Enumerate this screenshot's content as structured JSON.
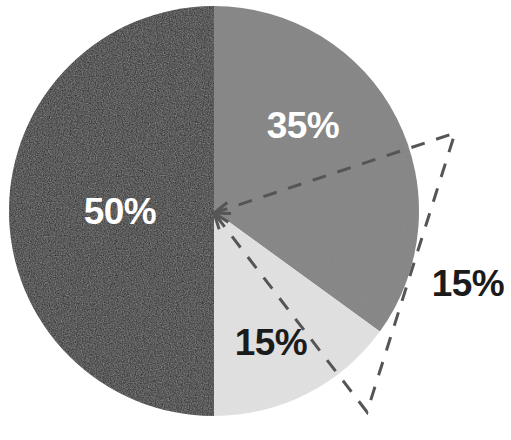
{
  "chart_data": {
    "type": "pie",
    "title": "",
    "subtitle": "",
    "xlabel": "",
    "ylabel": "",
    "legend": null,
    "grid": false,
    "categories": [
      "50%",
      "35%",
      "15%",
      "15%"
    ],
    "values": [
      50,
      35,
      15,
      15
    ],
    "slices": [
      {
        "label": "50%",
        "value": 50,
        "color": "#1a1a1a",
        "label_color": "#ffffff",
        "start_angle_deg": 180,
        "end_angle_deg": 360,
        "exploded": false,
        "callout": false
      },
      {
        "label": "35%",
        "value": 35,
        "color": "#8a8a8a",
        "label_color": "#ffffff",
        "start_angle_deg": 0,
        "end_angle_deg": 126,
        "exploded": false,
        "callout": false
      },
      {
        "label": "15%",
        "value": 15,
        "color": "#e2e2e2",
        "label_color": "#1b1b1b",
        "start_angle_deg": 126,
        "end_angle_deg": 180,
        "exploded": false,
        "callout": false
      },
      {
        "label": "15%",
        "value": 15,
        "color": "none",
        "label_color": "#1b1b1b",
        "start_angle_deg": 0,
        "end_angle_deg": 54,
        "exploded": true,
        "callout": true,
        "callout_style": "dashed-outline-wedge"
      }
    ],
    "total": 100,
    "units": "percent"
  },
  "figure": {
    "background_color": "#ffffff",
    "width": 511,
    "height": 440
  },
  "pie": {
    "center_x": 214,
    "center_y": 211,
    "radius": 205,
    "start_angle_deg": 0,
    "direction": "clockwise",
    "colors": {
      "dark": "#1a1a1a",
      "medium_gray": "#8a8a8a",
      "light_gray": "#e2e2e2",
      "callout_stroke": "#555555",
      "label_light": "#ffffff",
      "label_dark": "#1b1b1b"
    }
  },
  "labels": {
    "dark_slice": {
      "text": "50%",
      "x": 120,
      "y": 211,
      "color": "#ffffff"
    },
    "medium_slice": {
      "text": "35%",
      "x": 303,
      "y": 125,
      "color": "#ffffff"
    },
    "light_slice": {
      "text": "15%",
      "x": 271,
      "y": 342,
      "color": "#1b1b1b"
    },
    "callout_slice": {
      "text": "15%",
      "x": 468,
      "y": 283,
      "color": "#1b1b1b"
    }
  },
  "callout": {
    "name": "dashed-callout-wedge",
    "apex_x": 214,
    "apex_y": 213,
    "corner_top_x": 455,
    "corner_top_y": 133,
    "corner_bottom_x": 367,
    "corner_bottom_y": 412,
    "stroke_color": "#555555",
    "stroke_width": 3,
    "dash_pattern": "14 12",
    "arrowheads": 2
  }
}
